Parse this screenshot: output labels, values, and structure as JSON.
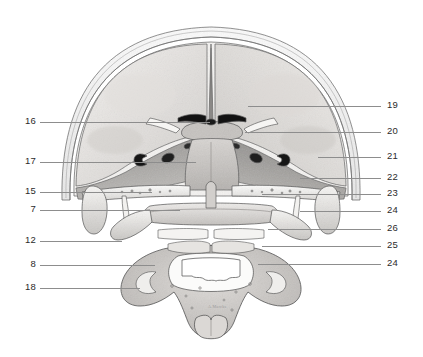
{
  "figure": {
    "background_color": "#ffffff",
    "leader_color": "#8d8d8d",
    "label_color": "#2b2b2b",
    "signature": "A.Marcks"
  },
  "labels_left": [
    {
      "number": "16",
      "y": 122,
      "leader_x1": 40,
      "leader_x2": 210
    },
    {
      "number": "17",
      "y": 162,
      "leader_x1": 40,
      "leader_x2": 196
    },
    {
      "number": "15",
      "y": 192,
      "leader_x1": 40,
      "leader_x2": 152
    },
    {
      "number": "7",
      "y": 210,
      "leader_x1": 40,
      "leader_x2": 180
    },
    {
      "number": "12",
      "y": 241,
      "leader_x1": 40,
      "leader_x2": 122
    },
    {
      "number": "8",
      "y": 265,
      "leader_x1": 40,
      "leader_x2": 155
    },
    {
      "number": "18",
      "y": 288,
      "leader_x1": 40,
      "leader_x2": 140
    }
  ],
  "labels_right": [
    {
      "number": "19",
      "y": 106,
      "leader_x1": 248,
      "leader_x2": 381
    },
    {
      "number": "20",
      "y": 132,
      "leader_x1": 245,
      "leader_x2": 381
    },
    {
      "number": "21",
      "y": 157,
      "leader_x1": 318,
      "leader_x2": 381
    },
    {
      "number": "22",
      "y": 178,
      "leader_x1": 300,
      "leader_x2": 381
    },
    {
      "number": "23",
      "y": 194,
      "leader_x1": 262,
      "leader_x2": 381
    },
    {
      "number": "24",
      "y": 211,
      "leader_x1": 300,
      "leader_x2": 381
    },
    {
      "number": "26",
      "y": 229,
      "leader_x1": 268,
      "leader_x2": 381
    },
    {
      "number": "25",
      "y": 246,
      "leader_x1": 262,
      "leader_x2": 381
    },
    {
      "number": "24",
      "y": 264,
      "leader_x1": 258,
      "leader_x2": 381
    }
  ]
}
